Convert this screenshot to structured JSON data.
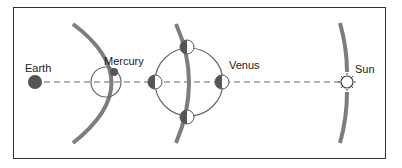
{
  "diagram": {
    "labels": {
      "earth": "Earth",
      "mercury": "Mercury",
      "venus": "Venus",
      "sun": "Sun"
    },
    "colors": {
      "arc": "#7a7a7a",
      "planet_fill": "#555555",
      "line": "#666666",
      "frame": "#333333"
    }
  }
}
